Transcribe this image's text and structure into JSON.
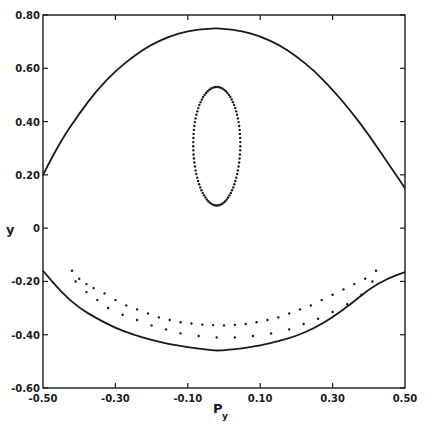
{
  "chart_data": {
    "type": "scatter",
    "title": "",
    "xlabel": "P",
    "xlabel_subscript": "y",
    "ylabel": "y",
    "xlim": [
      -0.5,
      0.5
    ],
    "ylim": [
      -0.6,
      0.8
    ],
    "grid": false,
    "legend": null,
    "x_ticks": [
      -0.5,
      -0.3,
      -0.1,
      0.1,
      0.3,
      0.5
    ],
    "x_tick_labels": [
      "-0.50",
      "-0.30",
      "-0.10",
      "0.10",
      "0.30",
      "0.50"
    ],
    "y_ticks": [
      0.8,
      0.6,
      0.4,
      0.2,
      0,
      -0.2,
      -0.4,
      -0.6
    ],
    "y_tick_labels": [
      "0.80",
      "0.60",
      "0.40",
      "0.20",
      "0",
      "-0.20",
      "-0.40",
      "-0.60"
    ],
    "series": [
      {
        "name": "energy boundary (upper)",
        "style": "solid-line",
        "points": [
          [
            -0.5,
            0.2
          ],
          [
            -0.45,
            0.33
          ],
          [
            -0.4,
            0.43
          ],
          [
            -0.35,
            0.52
          ],
          [
            -0.3,
            0.59
          ],
          [
            -0.25,
            0.645
          ],
          [
            -0.2,
            0.69
          ],
          [
            -0.15,
            0.72
          ],
          [
            -0.1,
            0.74
          ],
          [
            -0.05,
            0.748
          ],
          [
            -0.02,
            0.75
          ],
          [
            0.0,
            0.748
          ],
          [
            0.05,
            0.74
          ],
          [
            0.1,
            0.72
          ],
          [
            0.15,
            0.69
          ],
          [
            0.2,
            0.645
          ],
          [
            0.25,
            0.59
          ],
          [
            0.3,
            0.52
          ],
          [
            0.35,
            0.44
          ],
          [
            0.4,
            0.35
          ],
          [
            0.45,
            0.25
          ],
          [
            0.5,
            0.15
          ]
        ]
      },
      {
        "name": "energy boundary (lower)",
        "style": "solid-line",
        "points": [
          [
            -0.5,
            -0.16
          ],
          [
            -0.45,
            -0.24
          ],
          [
            -0.4,
            -0.3
          ],
          [
            -0.35,
            -0.34
          ],
          [
            -0.3,
            -0.375
          ],
          [
            -0.25,
            -0.4
          ],
          [
            -0.2,
            -0.42
          ],
          [
            -0.15,
            -0.435
          ],
          [
            -0.1,
            -0.447
          ],
          [
            -0.05,
            -0.455
          ],
          [
            -0.02,
            -0.46
          ],
          [
            0.0,
            -0.458
          ],
          [
            0.05,
            -0.452
          ],
          [
            0.1,
            -0.44
          ],
          [
            0.15,
            -0.425
          ],
          [
            0.2,
            -0.405
          ],
          [
            0.25,
            -0.375
          ],
          [
            0.3,
            -0.335
          ],
          [
            0.35,
            -0.285
          ],
          [
            0.4,
            -0.23
          ],
          [
            0.45,
            -0.19
          ],
          [
            0.5,
            -0.165
          ]
        ]
      },
      {
        "name": "invariant curve (island)",
        "style": "dots",
        "center": [
          -0.02,
          0.31
        ],
        "py_halfwidth": 0.065,
        "y_range": [
          0.085,
          0.53
        ]
      },
      {
        "name": "banana orbit (upper row)",
        "style": "dots",
        "points": [
          [
            -0.42,
            -0.16
          ],
          [
            -0.4,
            -0.19
          ],
          [
            -0.38,
            -0.21
          ],
          [
            -0.36,
            -0.225
          ],
          [
            -0.33,
            -0.245
          ],
          [
            -0.3,
            -0.27
          ],
          [
            -0.27,
            -0.29
          ],
          [
            -0.24,
            -0.305
          ],
          [
            -0.21,
            -0.32
          ],
          [
            -0.18,
            -0.335
          ],
          [
            -0.15,
            -0.345
          ],
          [
            -0.12,
            -0.353
          ],
          [
            -0.09,
            -0.358
          ],
          [
            -0.06,
            -0.362
          ],
          [
            -0.03,
            -0.364
          ],
          [
            0.0,
            -0.365
          ],
          [
            0.03,
            -0.363
          ],
          [
            0.06,
            -0.36
          ],
          [
            0.09,
            -0.353
          ],
          [
            0.12,
            -0.345
          ],
          [
            0.15,
            -0.335
          ],
          [
            0.18,
            -0.32
          ],
          [
            0.21,
            -0.305
          ],
          [
            0.24,
            -0.29
          ],
          [
            0.27,
            -0.27
          ],
          [
            0.3,
            -0.25
          ],
          [
            0.33,
            -0.23
          ],
          [
            0.36,
            -0.21
          ],
          [
            0.39,
            -0.19
          ],
          [
            0.42,
            -0.16
          ]
        ]
      },
      {
        "name": "banana orbit (lower row)",
        "style": "dots",
        "points": [
          [
            -0.41,
            -0.2
          ],
          [
            -0.38,
            -0.24
          ],
          [
            -0.35,
            -0.27
          ],
          [
            -0.32,
            -0.3
          ],
          [
            -0.28,
            -0.325
          ],
          [
            -0.24,
            -0.345
          ],
          [
            -0.2,
            -0.365
          ],
          [
            -0.16,
            -0.38
          ],
          [
            -0.12,
            -0.395
          ],
          [
            -0.07,
            -0.405
          ],
          [
            -0.02,
            -0.41
          ],
          [
            0.03,
            -0.41
          ],
          [
            0.08,
            -0.405
          ],
          [
            0.13,
            -0.395
          ],
          [
            0.18,
            -0.38
          ],
          [
            0.22,
            -0.36
          ],
          [
            0.26,
            -0.34
          ],
          [
            0.3,
            -0.315
          ],
          [
            0.34,
            -0.285
          ],
          [
            0.38,
            -0.25
          ],
          [
            0.41,
            -0.2
          ]
        ]
      }
    ]
  },
  "labels": {
    "x_axis_title_main": "P",
    "x_axis_title_sub": "y",
    "y_axis_title": "y"
  }
}
